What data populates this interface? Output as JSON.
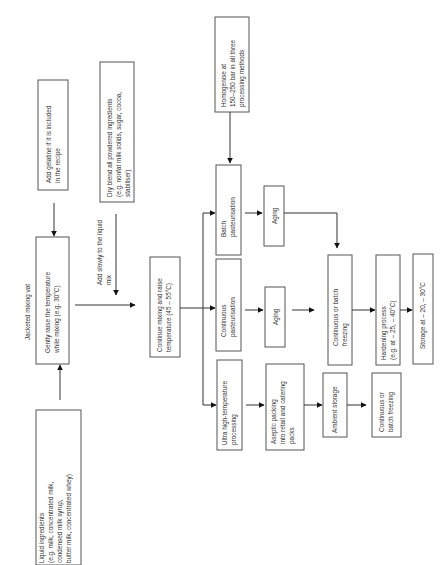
{
  "diagram": {
    "orientation": "rotated-90-ccw",
    "nodes": {
      "liquid": [
        "Liquid ingredients",
        "(e.g. milk, concentrated milk,",
        "condensed milk syrup,",
        "butter milk, concentrated whey)"
      ],
      "vat_label": [
        "Jacketed mixing vat"
      ],
      "gently": [
        "Gently raise the temperature",
        "while mixing (e.g. 30°C)"
      ],
      "gelatine": [
        "Add gelatine if it is included",
        "in the recipe"
      ],
      "dry_blend": [
        "Dry blend all powdered ingredients",
        "(e.g. nonfat milk solids, sugar, cocoa,",
        "stabiliser)"
      ],
      "add_slowly": [
        "Add slowly to the liquid",
        "mix"
      ],
      "continue_mixing": [
        "Continue mixing and raise",
        "temperature (45 – 55°C)"
      ],
      "homogenise": [
        "Homogenise at",
        "150–250 bar in all three",
        "processing methods"
      ],
      "batch_past": [
        "Batch",
        "pasteurisation"
      ],
      "cont_past": [
        "Continuous",
        "pasteurisation"
      ],
      "uht": [
        "Ultra high-temperature",
        "processing"
      ],
      "aging_batch": [
        "Aging"
      ],
      "aging_cont": [
        "Aging"
      ],
      "aseptic": [
        "Aseptic packing",
        "into retail and catering",
        "packs"
      ],
      "freezing": [
        "Continuous or batch",
        "freezing"
      ],
      "ambient": [
        "Ambient storage"
      ],
      "freezing2": [
        "Continuous or",
        "batch freezing"
      ],
      "hardening": [
        "Hardening process",
        "(e.g. at – 25, – 40°C)"
      ],
      "storage": [
        "Storage at – 20, – 30°C"
      ]
    }
  }
}
